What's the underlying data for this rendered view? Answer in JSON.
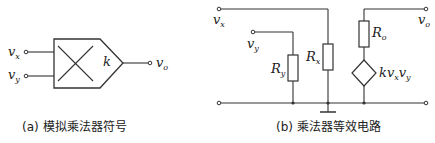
{
  "figure_a": {
    "caption": "(a)  模拟乘法器符号",
    "inputs": [
      {
        "name": "v",
        "sub": "x"
      },
      {
        "name": "v",
        "sub": "y"
      }
    ],
    "output": {
      "name": "v",
      "sub": "o"
    },
    "gain": "k"
  },
  "figure_b": {
    "caption": "(b)  乘法器等效电路",
    "nodes": {
      "vx": {
        "name": "v",
        "sub": "x"
      },
      "vy": {
        "name": "v",
        "sub": "y"
      },
      "vo": {
        "name": "v",
        "sub": "o"
      }
    },
    "components": {
      "Ry": {
        "name": "R",
        "sub": "y"
      },
      "Rx": {
        "name": "R",
        "sub": "x"
      },
      "Ro": {
        "name": "R",
        "sub": "o"
      },
      "source": {
        "k": "kv",
        "sub1": "x",
        "mid": "v",
        "sub2": "y"
      }
    }
  }
}
